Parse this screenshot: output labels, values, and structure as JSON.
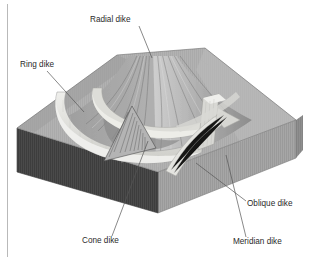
{
  "figure": {
    "background_color": "#ffffff"
  },
  "palette": {
    "block_top": "#b0b0b0",
    "block_top_light": "#c2c2c2",
    "block_front_left_dark": "#4a4a4a",
    "block_front_right": "#a6a6a6",
    "block_right_side": "#8f8f8f",
    "cone_shadow": "#8a8a8a",
    "cone_light": "#c8c8c8",
    "dike_light": "#e6e6e2",
    "dike_mid": "#d2d2ce",
    "leader_line": "#565656",
    "label_text": "#2b2b2b",
    "frame_rule": "#b9b9b9"
  },
  "labels": [
    {
      "id": "radial-dike",
      "text": "Radial dike",
      "text_x": 90,
      "text_y": 22,
      "leader": "M 139 26 L 152 58"
    },
    {
      "id": "ring-dike",
      "text": "Ring dike",
      "text_x": 20,
      "text_y": 67,
      "leader": "M 47 71 L 84 112"
    },
    {
      "id": "cone-dike",
      "text": "Cone dike",
      "text_x": 82,
      "text_y": 243,
      "leader": "M 112 236 L 148 141"
    },
    {
      "id": "oblique-dike",
      "text": "Oblique dike",
      "text_x": 247,
      "text_y": 206,
      "leader": "M 246 201 L 196 163"
    },
    {
      "id": "meridian-dike",
      "text": "Meridian dike",
      "text_x": 233,
      "text_y": 244,
      "leader": "M 246 237 L 226 155"
    }
  ],
  "frame": {
    "left_rule_x": 7,
    "left_rule_top": 4,
    "left_rule_bottom": 257
  }
}
